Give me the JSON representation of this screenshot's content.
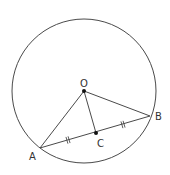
{
  "diagram": {
    "type": "geometry",
    "colors": {
      "line": "#4a4a4a",
      "point": "#111111",
      "label": "#333333",
      "background": "#ffffff"
    },
    "circle": {
      "name": "circle-O",
      "cx": 84,
      "cy": 91,
      "r": 72
    },
    "points": {
      "O": {
        "label": "O",
        "x": 84,
        "y": 91,
        "label_x": 80,
        "label_y": 87
      },
      "A": {
        "label": "A",
        "x": 40,
        "y": 148,
        "label_x": 29,
        "label_y": 160
      },
      "B": {
        "label": "B",
        "x": 150,
        "y": 116,
        "label_x": 155,
        "label_y": 120
      },
      "C": {
        "label": "C",
        "x": 96,
        "y": 133,
        "label_x": 97,
        "label_y": 147
      }
    },
    "segments": [
      {
        "name": "OA",
        "from": "O",
        "to": "A"
      },
      {
        "name": "OB",
        "from": "O",
        "to": "B"
      },
      {
        "name": "OC",
        "from": "O",
        "to": "C"
      },
      {
        "name": "AB",
        "from": "A",
        "to": "B"
      }
    ],
    "equal_marks": [
      {
        "segment": "AC",
        "ticks": 2,
        "x": 68,
        "y": 140
      },
      {
        "segment": "CB",
        "ticks": 2,
        "x": 123,
        "y": 124.5
      }
    ]
  }
}
